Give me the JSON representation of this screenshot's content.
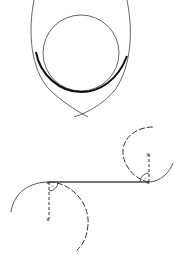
{
  "figures": [
    {
      "name": "curve-with-inscribed-circle",
      "description": "Two crossing arcs forming a pointed lens shape with an inscribed circle tangent at the bottom; thick bold tangent arc segment",
      "colors": {
        "stroke": "#444444",
        "bold_stroke": "#111111"
      }
    },
    {
      "name": "tangent-line-between-circles",
      "description": "Straight tangent line connecting two dashed circular arcs, with radius markers (dashed) and right-angle symbols at tangency points",
      "colors": {
        "stroke": "#444444",
        "dashed": "#333333"
      }
    }
  ]
}
